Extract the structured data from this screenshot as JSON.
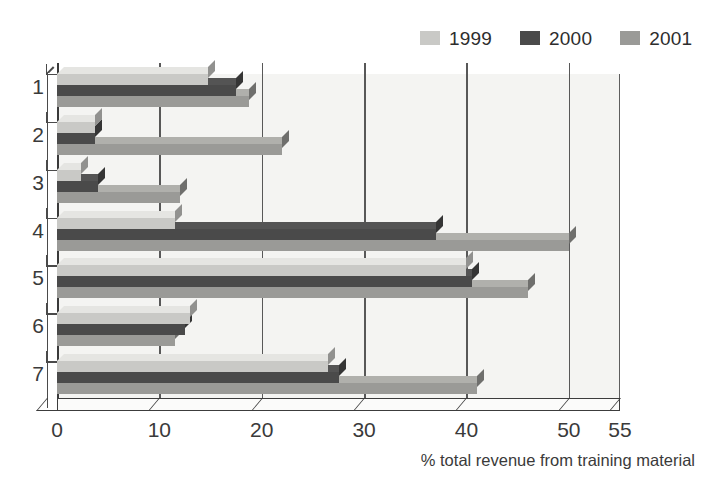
{
  "chart_data": {
    "type": "bar",
    "orientation": "horizontal",
    "title": "",
    "subtitle": "",
    "xlabel": "% total revenue from training material",
    "ylabel": "",
    "categories": [
      "1",
      "2",
      "3",
      "4",
      "5",
      "6",
      "7"
    ],
    "series": [
      {
        "name": "1999",
        "color": "#c9c9c6",
        "values": [
          14.8,
          3.7,
          2.3,
          11.5,
          40.0,
          13.0,
          26.5
        ]
      },
      {
        "name": "2000",
        "color": "#4a4a4a",
        "values": [
          17.5,
          3.7,
          4.0,
          37.0,
          40.5,
          12.5,
          27.5
        ]
      },
      {
        "name": "2001",
        "color": "#9a9a97",
        "values": [
          18.8,
          22.0,
          12.0,
          50.0,
          46.0,
          11.5,
          41.0
        ]
      }
    ],
    "xlim": [
      0,
      55
    ],
    "xticks": [
      0,
      10,
      20,
      30,
      40,
      50,
      55
    ],
    "xtick_labels": [
      "0",
      "10",
      "20",
      "30",
      "40",
      "50",
      "55"
    ],
    "gridlines": [
      10,
      20,
      30,
      40,
      50
    ],
    "grid": true,
    "legend_position": "top-right",
    "style": "3d-bevelled",
    "plot_background": "#f4f4f2",
    "grid_color": "#585858",
    "axis_color": "#3c3c3c"
  },
  "legend": {
    "items": [
      {
        "label": "1999",
        "color": "#c9c9c6"
      },
      {
        "label": "2000",
        "color": "#4a4a4a"
      },
      {
        "label": "2001",
        "color": "#9a9a97"
      }
    ]
  }
}
